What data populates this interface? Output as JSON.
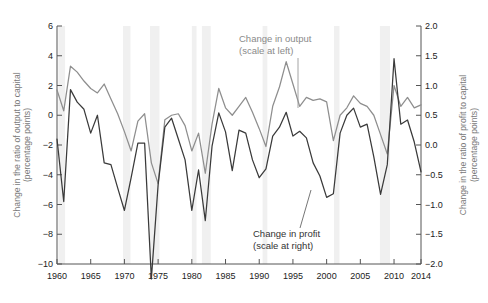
{
  "chart_data": {
    "type": "line",
    "title": "",
    "xlabel": "",
    "ylabel": "Change in the ratio of output to capital (percentage points)",
    "y2label": "Change in the ratio of profit to capital (percentage points)",
    "xlim": [
      1960,
      2014
    ],
    "ylim": [
      -10,
      6
    ],
    "y2lim": [
      -2.0,
      2.0
    ],
    "grid": false,
    "legend_position": "inline-annotations",
    "xticks": [
      1960,
      1965,
      1970,
      1975,
      1980,
      1985,
      1990,
      1995,
      2000,
      2005,
      2010,
      2014
    ],
    "xticklabels": [
      "1960",
      "1965",
      "1970",
      "1975",
      "1980",
      "1985",
      "1990",
      "1995",
      "2000",
      "2005",
      "2010",
      "2014"
    ],
    "yticks": [
      6,
      4,
      2,
      0,
      -2,
      -4,
      -6,
      -8,
      -10
    ],
    "yticklabels": [
      "6",
      "4",
      "2",
      "0",
      "−2",
      "−4",
      "−6",
      "−8",
      "−10"
    ],
    "y2ticks": [
      2.0,
      1.5,
      1.0,
      0.5,
      0.0,
      -0.5,
      -1.0,
      -1.5,
      -2.0
    ],
    "y2ticklabels": [
      "2.0",
      "1.5",
      "1.0",
      "0.5",
      "0.0",
      "−0.5",
      "−1.0",
      "−1.5",
      "−2.0"
    ],
    "annotations": [
      {
        "name": "output-label",
        "line1": "Change in output",
        "line2": "(scale at left)"
      },
      {
        "name": "profit-label",
        "line1": "Change in profit",
        "line2": "(scale at right)"
      }
    ],
    "recession_bands": [
      {
        "start": 1960.2,
        "end": 1961.2
      },
      {
        "start": 1969.8,
        "end": 1970.9
      },
      {
        "start": 1973.8,
        "end": 1975.2
      },
      {
        "start": 1980.0,
        "end": 1980.7
      },
      {
        "start": 1981.5,
        "end": 1982.8
      },
      {
        "start": 1990.5,
        "end": 1991.2
      },
      {
        "start": 2001.1,
        "end": 2001.9
      },
      {
        "start": 2007.9,
        "end": 2009.4
      }
    ],
    "x": [
      1960,
      1961,
      1962,
      1963,
      1964,
      1965,
      1966,
      1967,
      1968,
      1969,
      1970,
      1971,
      1972,
      1973,
      1974,
      1975,
      1976,
      1977,
      1978,
      1979,
      1980,
      1981,
      1982,
      1983,
      1984,
      1985,
      1986,
      1987,
      1988,
      1989,
      1990,
      1991,
      1992,
      1993,
      1994,
      1995,
      1996,
      1997,
      1998,
      1999,
      2000,
      2001,
      2002,
      2003,
      2004,
      2005,
      2006,
      2007,
      2008,
      2009,
      2010,
      2011,
      2012,
      2013,
      2014
    ],
    "series": [
      {
        "name": "Change in output",
        "scale": "left",
        "color": "#8e8e8e",
        "values": [
          1.7,
          0.3,
          3.3,
          2.9,
          2.3,
          1.8,
          1.5,
          2.1,
          1.1,
          0.1,
          -1.1,
          -2.4,
          -0.4,
          0.1,
          -3.2,
          -4.6,
          -0.3,
          0.0,
          0.1,
          -0.7,
          -2.4,
          -1.2,
          -3.9,
          -0.6,
          1.8,
          0.5,
          0.0,
          0.6,
          1.2,
          0.2,
          -0.9,
          -2.1,
          0.6,
          1.9,
          3.6,
          2.1,
          0.6,
          1.2,
          1.0,
          1.1,
          0.9,
          -1.7,
          0.0,
          0.5,
          1.3,
          0.8,
          0.6,
          0.0,
          -1.3,
          -2.6,
          2.0,
          0.6,
          1.2,
          0.5,
          0.7
        ]
      },
      {
        "name": "Change in profit",
        "scale": "right",
        "color": "#3a3a3a",
        "values": [
          0.1,
          -0.95,
          0.93,
          0.72,
          0.6,
          0.2,
          0.5,
          -0.3,
          -0.33,
          -0.72,
          -1.1,
          -0.55,
          0.03,
          0.03,
          -2.25,
          -0.67,
          0.3,
          0.45,
          0.1,
          -0.25,
          -1.1,
          -0.42,
          -1.27,
          -0.02,
          0.54,
          0.22,
          -0.43,
          0.25,
          0.2,
          -0.25,
          -0.55,
          -0.4,
          0.15,
          0.3,
          0.55,
          0.15,
          0.23,
          0.12,
          -0.3,
          -0.52,
          -0.88,
          -0.82,
          0.2,
          0.5,
          0.62,
          0.3,
          0.35,
          -0.2,
          -0.83,
          -0.33,
          1.45,
          0.35,
          0.42,
          0.05,
          -0.45
        ]
      }
    ]
  }
}
